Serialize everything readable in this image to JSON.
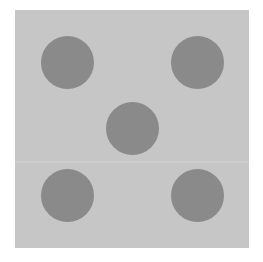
{
  "image": {
    "subject": "die face showing five",
    "value": 5,
    "colors": {
      "background": "#ffffff",
      "face": "#c6c6c6",
      "pip": "#8a8a8a"
    },
    "pips": [
      {
        "position": "top-left",
        "cx": 67,
        "cy": 62
      },
      {
        "position": "top-right",
        "cx": 197,
        "cy": 62
      },
      {
        "position": "center",
        "cx": 132,
        "cy": 128
      },
      {
        "position": "bottom-left",
        "cx": 67,
        "cy": 195
      },
      {
        "position": "bottom-right",
        "cx": 197,
        "cy": 195
      }
    ]
  }
}
